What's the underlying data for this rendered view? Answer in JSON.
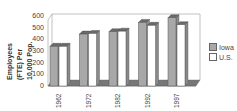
{
  "chart_data": {
    "type": "bar",
    "title": "",
    "xlabel": "",
    "ylabel": "Employees (FTE) Per 10,000 Pop.",
    "categories": [
      "1962",
      "1972",
      "1982",
      "1992",
      "1997"
    ],
    "series": [
      {
        "name": "Iowa",
        "values": [
          340,
          445,
          465,
          545,
          585
        ],
        "color": "#a8a8a8"
      },
      {
        "name": "U.S.",
        "values": [
          340,
          450,
          470,
          520,
          525
        ],
        "color": "#ffffff"
      }
    ],
    "ylim": [
      0,
      600
    ],
    "yticks": [
      "0",
      "100",
      "200",
      "300",
      "400",
      "500",
      "600"
    ],
    "grid": false,
    "legend_position": "right",
    "style": "3d-bar"
  },
  "ylabel_lines": [
    "Employees",
    "(FTE)  Per",
    "10,000  Pop."
  ],
  "legend": [
    {
      "label": "Iowa",
      "color": "#a8a8a8"
    },
    {
      "label": "U.S.",
      "color": "#ffffff"
    }
  ]
}
